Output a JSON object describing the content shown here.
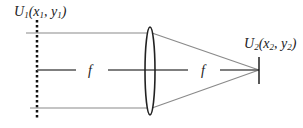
{
  "diagram": {
    "input_label": {
      "func": "U",
      "sub": "1",
      "open": "(x",
      "x_sub": "1",
      "mid": ", y",
      "y_sub": "1",
      "close": ")"
    },
    "output_label": {
      "func": "U",
      "sub": "2",
      "open": "(x",
      "x_sub": "2",
      "mid": ", y",
      "y_sub": "2",
      "close": ")"
    },
    "focal_label_left": "f",
    "focal_label_right": "f",
    "colors": {
      "ray": "#8a8a8a",
      "axis": "#555555",
      "lens": "#222222",
      "plane": "#111111"
    }
  }
}
